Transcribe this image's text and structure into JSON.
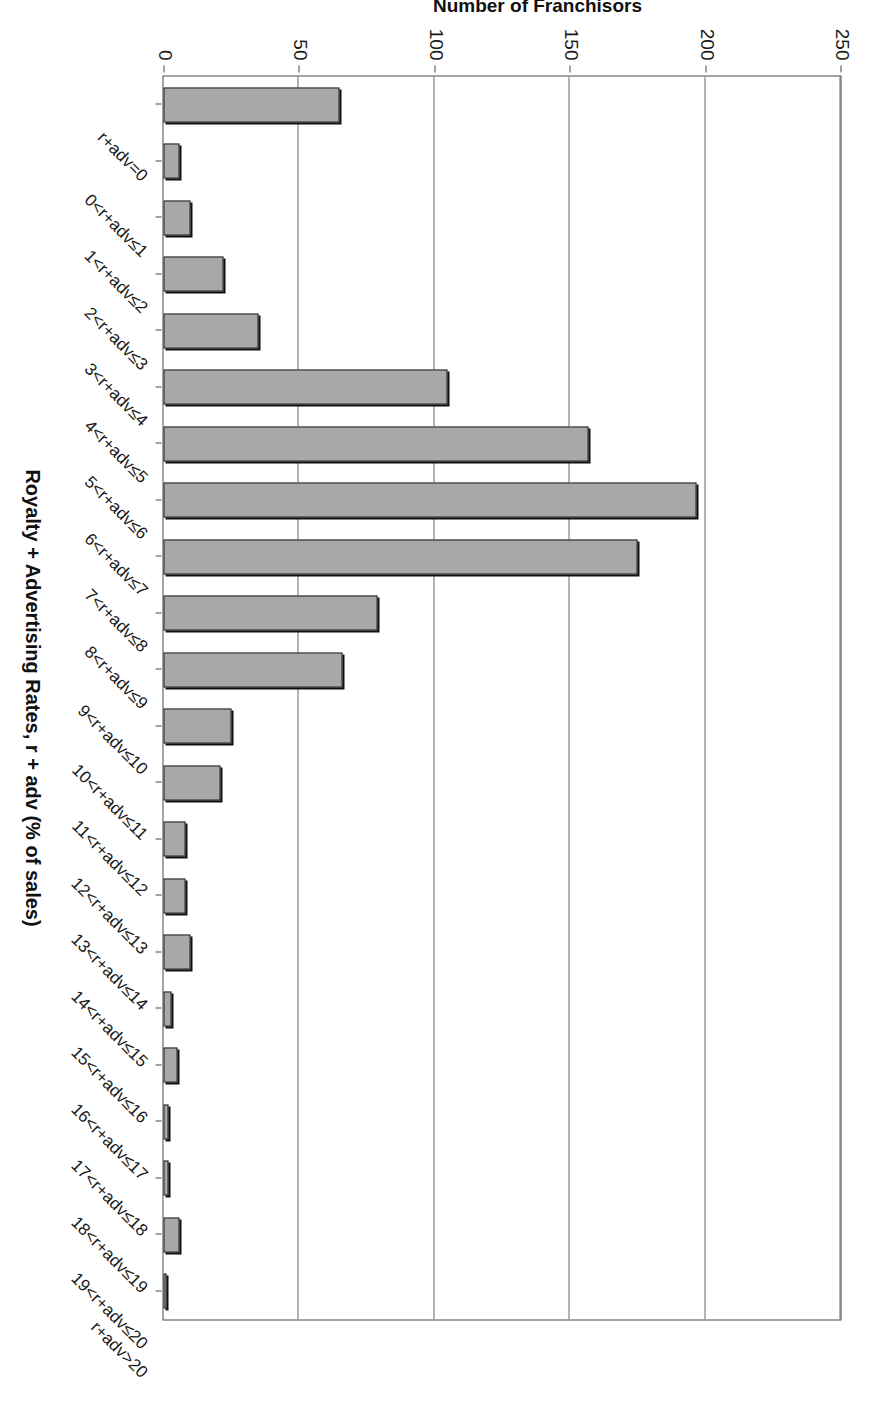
{
  "chart_data": {
    "type": "bar",
    "orientation": "vertical",
    "title": "",
    "xlabel": "Royalty + Advertising Rates, r + adv (% of sales)",
    "ylabel": "Number of Franchisors",
    "ylim": [
      0,
      250
    ],
    "ytick_values": [
      0,
      50,
      100,
      150,
      200,
      250
    ],
    "ytick_labels": [
      "0",
      "50",
      "100",
      "150",
      "200",
      "250"
    ],
    "grid": true,
    "legend_position": "none",
    "bar_fill_color": "#a8a8a8",
    "bar_edge_color": "#222222",
    "categories": [
      "r+adv=0",
      "0<r+adv≤1",
      "1<r+adv≤2",
      "2<r+adv≤3",
      "3<r+adv≤4",
      "4<r+adv≤5",
      "5<r+adv≤6",
      "6<r+adv≤7",
      "7<r+adv≤8",
      "8<r+adv≤9",
      "9<r+adv≤10",
      "10<r+adv≤11",
      "11<r+adv≤12",
      "12<r+adv≤13",
      "13<r+adv≤14",
      "14<r+adv≤15",
      "15<r+adv≤16",
      "16<r+adv≤17",
      "17<r+adv≤18",
      "18<r+adv≤19",
      "19<r+adv≤20",
      "r+adv>20"
    ],
    "values": [
      65,
      6,
      10,
      22,
      35,
      105,
      157,
      197,
      175,
      79,
      66,
      25,
      21,
      8,
      8,
      10,
      3,
      5,
      2,
      2,
      6,
      1
    ]
  }
}
